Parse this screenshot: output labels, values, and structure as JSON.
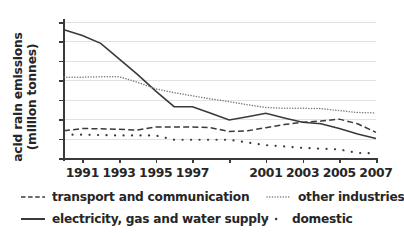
{
  "chart_data": {
    "type": "line",
    "title": "",
    "xlabel": "",
    "ylabel": "acid rain emissions (million tonnes)",
    "ylabel_line1": "acid rain emissions",
    "ylabel_line2": "(million tonnes)",
    "xlim": [
      1990,
      2007
    ],
    "ylim": [
      0,
      3.5
    ],
    "grid": "horizontal",
    "legend_position": "bottom",
    "y_ticks": [
      "0",
      "0.5",
      "1",
      "1.5",
      "2",
      "2.5",
      "3",
      "3.5"
    ],
    "y_tick_values": [
      0,
      0.5,
      1,
      1.5,
      2,
      2.5,
      3,
      3.5
    ],
    "x_ticks": [
      "1991",
      "1993",
      "1995",
      "1997",
      "",
      "2001",
      "2003",
      "2005",
      "2007"
    ],
    "x_tick_values": [
      1991,
      1993,
      1995,
      1997,
      1999,
      2001,
      2003,
      2005,
      2007
    ],
    "x": [
      1990,
      1991,
      1992,
      1993,
      1994,
      1995,
      1996,
      1997,
      1998,
      1999,
      2000,
      2001,
      2002,
      2003,
      2004,
      2005,
      2006,
      2007
    ],
    "series": [
      {
        "name": "electricity, gas and water supply",
        "style": "solid",
        "color": "#3a3a3a",
        "values": [
          3.3,
          3.15,
          2.95,
          2.55,
          2.15,
          1.72,
          1.32,
          1.32,
          1.15,
          0.98,
          1.06,
          1.15,
          1.03,
          0.92,
          0.88,
          0.76,
          0.62,
          0.5
        ]
      },
      {
        "name": "other industries",
        "style": "dotted",
        "color": "#7a7a7a",
        "values": [
          2.08,
          2.08,
          2.09,
          2.09,
          1.95,
          1.78,
          1.68,
          1.6,
          1.52,
          1.45,
          1.37,
          1.3,
          1.28,
          1.28,
          1.27,
          1.22,
          1.17,
          1.16
        ]
      },
      {
        "name": "transport and communication",
        "style": "dashed",
        "color": "#3a3a3a",
        "values": [
          0.7,
          0.76,
          0.75,
          0.74,
          0.72,
          0.8,
          0.8,
          0.8,
          0.78,
          0.68,
          0.7,
          0.78,
          0.86,
          0.92,
          0.95,
          1.0,
          0.88,
          0.66
        ]
      },
      {
        "name": "domestic",
        "style": "dots",
        "color": "#3a3a3a",
        "values": [
          0.6,
          0.6,
          0.59,
          0.58,
          0.58,
          0.58,
          0.47,
          0.47,
          0.47,
          0.47,
          0.4,
          0.33,
          0.3,
          0.26,
          0.24,
          0.22,
          0.13,
          0.12
        ]
      }
    ],
    "legend": [
      {
        "label": "transport and communication",
        "style": "dashed"
      },
      {
        "label": "other industries",
        "style": "dotted"
      },
      {
        "label": "electricity, gas and water supply",
        "style": "solid"
      },
      {
        "label": "domestic",
        "style": "dots"
      }
    ]
  }
}
